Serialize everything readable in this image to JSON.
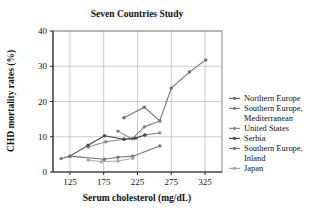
{
  "chart_data": {
    "type": "line",
    "title": "Seven Countries Study",
    "xlabel": "Serum cholesterol (mg/dL)",
    "ylabel": "CHD mortality rates (%)",
    "xlim": [
      100,
      350
    ],
    "ylim": [
      0,
      40
    ],
    "xticks": [
      125,
      175,
      225,
      275,
      325
    ],
    "yticks": [
      0,
      10,
      20,
      30,
      40
    ],
    "xtick_labels": [
      "125",
      "175",
      "225",
      "275",
      "325"
    ],
    "ytick_labels": [
      "0",
      "10",
      "20",
      "30",
      "40"
    ],
    "grid": true,
    "legend_position": "right",
    "series": [
      {
        "name": "Northern Europe",
        "color": "#6e6e6e",
        "points": [
          {
            "x": 205,
            "y": 15.4
          },
          {
            "x": 235,
            "y": 18.4
          },
          {
            "x": 258,
            "y": 14.5
          },
          {
            "x": 275,
            "y": 23.8
          },
          {
            "x": 302,
            "y": 28.4
          },
          {
            "x": 326,
            "y": 31.8
          }
        ]
      },
      {
        "name": "Southern Europe, Mediterranean",
        "color": "#808080",
        "points": [
          {
            "x": 196,
            "y": 11.6
          },
          {
            "x": 217,
            "y": 9.4
          },
          {
            "x": 235,
            "y": 12.8
          },
          {
            "x": 258,
            "y": 14.5
          }
        ]
      },
      {
        "name": "United States",
        "color": "#8a8a8a",
        "points": [
          {
            "x": 152,
            "y": 7.1
          },
          {
            "x": 178,
            "y": 8.6
          },
          {
            "x": 205,
            "y": 9.3
          },
          {
            "x": 218,
            "y": 9.4
          },
          {
            "x": 236,
            "y": 10.5
          },
          {
            "x": 258,
            "y": 11.1
          }
        ]
      },
      {
        "name": "Serbia",
        "color": "#4a4a4a",
        "points": [
          {
            "x": 125,
            "y": 4.5
          },
          {
            "x": 152,
            "y": 7.6
          },
          {
            "x": 176,
            "y": 10.3
          },
          {
            "x": 205,
            "y": 9.3
          },
          {
            "x": 222,
            "y": 9.6
          },
          {
            "x": 236,
            "y": 10.5
          }
        ]
      },
      {
        "name": "Southern Europe, Inland",
        "color": "#777777",
        "points": [
          {
            "x": 112,
            "y": 3.8
          },
          {
            "x": 125,
            "y": 4.5
          },
          {
            "x": 176,
            "y": 3.6
          },
          {
            "x": 196,
            "y": 4.2
          },
          {
            "x": 218,
            "y": 4.5
          },
          {
            "x": 258,
            "y": 7.4
          }
        ]
      },
      {
        "name": "Japan",
        "color": "#a9a9a9",
        "points": [
          {
            "x": 152,
            "y": 3.4
          },
          {
            "x": 172,
            "y": 2.9
          },
          {
            "x": 196,
            "y": 3.1
          },
          {
            "x": 218,
            "y": 3.9
          }
        ]
      }
    ]
  },
  "legend": {
    "items": [
      {
        "label": "Northern Europe",
        "color": "#6e6e6e"
      },
      {
        "label": "Southern Europe,",
        "label2": "Mediterranean",
        "color": "#808080"
      },
      {
        "label": "United States",
        "color": "#8a8a8a"
      },
      {
        "label": "Serbia",
        "color": "#4a4a4a"
      },
      {
        "label": "Southern Europe,",
        "label2": "Inland",
        "color": "#777777"
      },
      {
        "label": "Japan",
        "color": "#a9a9a9"
      }
    ]
  }
}
